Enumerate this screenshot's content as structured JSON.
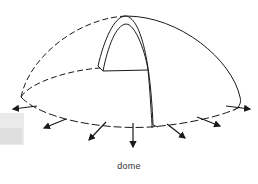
{
  "figure": {
    "caption": "dome",
    "stroke_color": "#1a1a1a",
    "arrows": {
      "count": 8,
      "direction": "outward-thrust"
    }
  }
}
